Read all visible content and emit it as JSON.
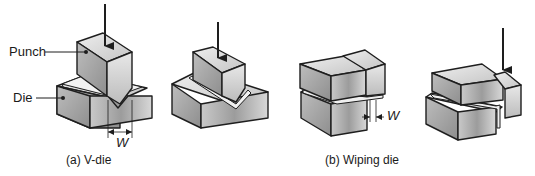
{
  "figure": {
    "panels": [
      {
        "id": "a",
        "caption": "(a) V-die",
        "part_labels": {
          "punch": "Punch",
          "die": "Die"
        },
        "dimension_label": "W"
      },
      {
        "id": "b",
        "caption": "(b) Wiping die",
        "dimension_label": "W"
      }
    ],
    "colors": {
      "outline": "#1e1e1e",
      "face_light": "#e4e4e4",
      "face_mid": "#b8b8b8",
      "face_dark": "#8a8a8a",
      "background": "#ffffff"
    }
  }
}
